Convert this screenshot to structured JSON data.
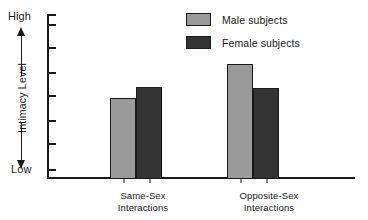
{
  "chart_data": {
    "type": "bar",
    "title": "",
    "xlabel": "",
    "ylabel": "Intimacy Level",
    "categories": [
      "Same-Sex\nInteractions",
      "Opposite-Sex\nInteractions"
    ],
    "category_lines": [
      [
        "Same-Sex",
        "Interactions"
      ],
      [
        "Opposite-Sex",
        "Interactions"
      ]
    ],
    "series": [
      {
        "name": "Male subjects",
        "color": "#9a9a9a",
        "values": [
          0.49,
          0.7
        ]
      },
      {
        "name": "Female subjects",
        "color": "#333333",
        "values": [
          0.56,
          0.55
        ]
      }
    ],
    "ylim": [
      0,
      1
    ],
    "y_axis_low_label": "Low",
    "y_axis_high_label": "High",
    "y_tick_positions": [
      0.06,
      0.22,
      0.36,
      0.51,
      0.65,
      0.8,
      0.94
    ],
    "y_tick_labels": [],
    "grid": false,
    "legend_position": "top-right",
    "annotations": []
  },
  "axis": {
    "high": "High",
    "low": "Low",
    "title": "Intimacy Level"
  },
  "legend": {
    "items": [
      {
        "label": "Male subjects"
      },
      {
        "label": "Female subjects"
      }
    ]
  },
  "colors": {
    "male": "#9a9a9a",
    "female": "#333333",
    "ink": "#1a1a1a",
    "background": "#ffffff"
  }
}
